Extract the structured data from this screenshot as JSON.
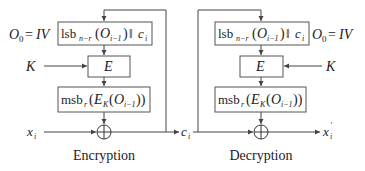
{
  "diagram": {
    "type": "block-diagram",
    "encryption": {
      "caption": "Encryption",
      "iv_label": "O₀ = IV",
      "shift_box": "lsbₙ₋ᵣ(Oᵢ₋₁)‖cᵢ",
      "cipher_box": "E",
      "key_label": "K",
      "msb_box": "msbᵣ(Eₖ(Oᵢ₋₁))",
      "input_label": "xᵢ",
      "xor_symbol": "⊕",
      "output_label": "cᵢ"
    },
    "decryption": {
      "caption": "Decryption",
      "iv_label": "O₀ = IV",
      "shift_box": "lsbₙ₋ᵣ(Oᵢ₋₁)‖cᵢ",
      "cipher_box": "E",
      "key_label": "K",
      "msb_box": "msbᵣ(Eₖ(Oᵢ₋₁))",
      "input_label": "cᵢ",
      "xor_symbol": "⊕",
      "output_label": "x′ᵢ"
    },
    "edges": [
      {
        "from": "enc.shift_box",
        "to": "enc.cipher_box"
      },
      {
        "from": "enc.key",
        "to": "enc.cipher_box"
      },
      {
        "from": "enc.cipher_box",
        "to": "enc.msb_box"
      },
      {
        "from": "enc.msb_box",
        "to": "enc.xor"
      },
      {
        "from": "enc.input",
        "to": "enc.xor"
      },
      {
        "from": "enc.xor",
        "to": "c_i"
      },
      {
        "from": "c_i",
        "to": "enc.shift_box",
        "note": "feedback"
      },
      {
        "from": "c_i",
        "to": "dec.xor"
      },
      {
        "from": "c_i",
        "to": "dec.shift_box",
        "note": "feedback"
      },
      {
        "from": "dec.shift_box",
        "to": "dec.cipher_box"
      },
      {
        "from": "dec.key",
        "to": "dec.cipher_box"
      },
      {
        "from": "dec.cipher_box",
        "to": "dec.msb_box"
      },
      {
        "from": "dec.msb_box",
        "to": "dec.xor"
      },
      {
        "from": "dec.xor",
        "to": "dec.output"
      }
    ]
  },
  "text": {
    "enc_iv_O": "O",
    "enc_iv_sub": "0",
    "enc_iv_eq": "=",
    "enc_iv_val": "IV",
    "lsb": "lsb",
    "lsb_sub": "n−r",
    "paren_open": "(",
    "O": "O",
    "O_sub": "i−1",
    "paren_close": ")",
    "concat": "‖",
    "c": "c",
    "i": "i",
    "E": "E",
    "K": "K",
    "msb": "msb",
    "msb_sub": "r",
    "E_K_sub": "K",
    "close2": "))",
    "x": "x",
    "prime": "′",
    "xor": "⊕",
    "enc_caption": "Encryption",
    "dec_caption": "Decryption"
  }
}
